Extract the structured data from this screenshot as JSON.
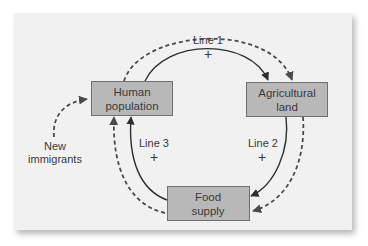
{
  "diagram": {
    "type": "causal-loop",
    "nodes": [
      {
        "id": "human",
        "label_line1": "Human",
        "label_line2": "population"
      },
      {
        "id": "agri",
        "label_line1": "Agricultural",
        "label_line2": "land"
      },
      {
        "id": "food",
        "label_line1": "Food",
        "label_line2": "supply"
      }
    ],
    "edges": [
      {
        "id": "line1",
        "label": "Line 1",
        "sign": "+",
        "from": "Human population",
        "to": "Agricultural land",
        "style": "solid"
      },
      {
        "id": "line2",
        "label": "Line 2",
        "sign": "+",
        "from": "Agricultural land",
        "to": "Food supply",
        "style": "solid"
      },
      {
        "id": "line3",
        "label": "Line 3",
        "sign": "+",
        "from": "Food supply",
        "to": "Human population",
        "style": "solid"
      },
      {
        "id": "outer1",
        "from": "Human population",
        "to": "Agricultural land",
        "style": "dashed"
      },
      {
        "id": "outer2",
        "from": "Agricultural land",
        "to": "Food supply",
        "style": "dashed"
      },
      {
        "id": "outer3",
        "from": "Food supply",
        "to": "Human population",
        "style": "dashed"
      }
    ],
    "external_input": {
      "label_line1": "New",
      "label_line2": "immigrants",
      "to": "Human population",
      "style": "dashed"
    },
    "colors": {
      "panel_bg": "#f1f1f1",
      "box_fill": "#b8b8b8",
      "box_stroke": "#707070",
      "line": "#2e2e2e",
      "text": "#3a3a3a"
    }
  }
}
